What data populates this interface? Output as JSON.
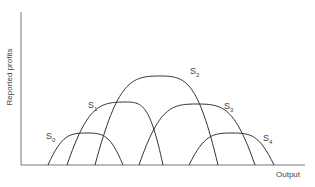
{
  "chart_data": {
    "type": "line",
    "title": "",
    "xlabel": "Output",
    "ylabel": "Reported profits",
    "grid": false,
    "ticks": "none",
    "series": [
      {
        "name": "S0",
        "label_base": "S",
        "label_sub": "0",
        "x_start": 48,
        "x_end": 123,
        "peak_x": 87,
        "peak_y": 133,
        "label_x": 46,
        "label_y": 140
      },
      {
        "name": "S1",
        "label_base": "S",
        "label_sub": "1",
        "x_start": 67,
        "x_end": 163,
        "peak_x": 126,
        "peak_y": 102,
        "label_x": 88,
        "label_y": 109
      },
      {
        "name": "S2",
        "label_base": "S",
        "label_sub": "2",
        "x_start": 95,
        "x_end": 218,
        "peak_x": 160,
        "peak_y": 76,
        "label_x": 190,
        "label_y": 75
      },
      {
        "name": "S3",
        "label_base": "S",
        "label_sub": "3",
        "x_start": 139,
        "x_end": 255,
        "peak_x": 197,
        "peak_y": 104,
        "label_x": 224,
        "label_y": 110
      },
      {
        "name": "S4",
        "label_base": "S",
        "label_sub": "4",
        "x_start": 189,
        "x_end": 274,
        "peak_x": 232,
        "peak_y": 133,
        "label_x": 263,
        "label_y": 142
      }
    ]
  },
  "axes": {
    "y_label": "Reported profits",
    "x_label": "Output",
    "origin_x": 21,
    "baseline_y": 165,
    "y_top": 12,
    "x_end": 305
  }
}
